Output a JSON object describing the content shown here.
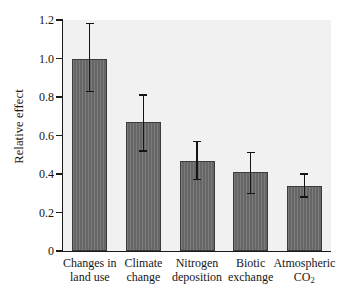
{
  "chart_data": {
    "type": "bar",
    "title": "",
    "xlabel": "",
    "ylabel": "Relative effect",
    "ylim": [
      0,
      1.2
    ],
    "ytick_labels": [
      "0",
      "0.2",
      "0.4",
      "0.6",
      "0.8",
      "1.0",
      "1.2"
    ],
    "ytick_values": [
      0,
      0.2,
      0.4,
      0.6,
      0.8,
      1.0,
      1.2
    ],
    "grid": false,
    "legend": "none",
    "categories": [
      "Changes in land use",
      "Climate change",
      "Nitrogen deposition",
      "Biotic exchange",
      "Atmospheric CO2"
    ],
    "category_lines": [
      [
        "Changes in",
        "land use"
      ],
      [
        "Climate",
        "change"
      ],
      [
        "Nitrogen",
        "deposition"
      ],
      [
        "Biotic",
        "exchange"
      ],
      [
        "Atmospheric",
        "CO2"
      ]
    ],
    "values": [
      1.0,
      0.67,
      0.47,
      0.41,
      0.34
    ],
    "error_upper": [
      1.18,
      0.81,
      0.57,
      0.51,
      0.4
    ],
    "error_lower": [
      0.83,
      0.52,
      0.37,
      0.3,
      0.28
    ],
    "bar_color": "#6b6b6b",
    "bar_edge_color": "#3b3b3b",
    "error_color": "#141414",
    "plot_background": "#f1f1f1",
    "axis_color": "#1a1a1a"
  }
}
